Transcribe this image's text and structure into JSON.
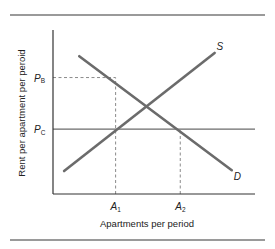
{
  "chart_data": {
    "type": "line",
    "title": "",
    "xlabel": "Apartments per period",
    "ylabel": "Rent per apartment per peroid",
    "xlim": [
      0,
      10
    ],
    "ylim": [
      0,
      10
    ],
    "grid": false,
    "series": [
      {
        "name": "S",
        "label": "S",
        "role": "supply",
        "color": "#6b6b6b",
        "points": [
          [
            0.55,
            1.4
          ],
          [
            8.0,
            8.6
          ]
        ]
      },
      {
        "name": "D",
        "label": "D",
        "role": "demand",
        "color": "#6b6b6b",
        "points": [
          [
            1.3,
            8.4
          ],
          [
            8.85,
            1.45
          ]
        ]
      }
    ],
    "reference_lines": [
      {
        "name": "price-ceiling",
        "orientation": "horizontal",
        "value": 3.95,
        "style": "solid",
        "color": "#6b6b6b",
        "label": "P_C",
        "label_main": "P",
        "label_sub": "C"
      }
    ],
    "guides": [
      {
        "name": "pb-guide",
        "from": [
          0,
          7.1
        ],
        "to": [
          3.1,
          7.1
        ],
        "style": "dashed"
      },
      {
        "name": "a1-guide",
        "from": [
          3.1,
          0
        ],
        "to": [
          3.1,
          7.1
        ],
        "style": "dashed"
      },
      {
        "name": "a2-guide",
        "from": [
          6.3,
          0
        ],
        "to": [
          6.3,
          3.95
        ],
        "style": "dashed"
      }
    ],
    "y_ticks": [
      {
        "value": 7.1,
        "main": "P",
        "sub": "B"
      },
      {
        "value": 3.95,
        "main": "P",
        "sub": "C"
      }
    ],
    "x_ticks": [
      {
        "value": 3.1,
        "main": "A",
        "sub": "1"
      },
      {
        "value": 6.3,
        "main": "A",
        "sub": "2"
      }
    ],
    "colors": {
      "axis": "#333333",
      "rule": "#9a9a9a",
      "curve": "#6b6b6b",
      "guide": "#8a8a8a"
    }
  }
}
